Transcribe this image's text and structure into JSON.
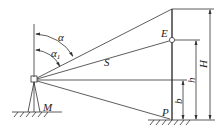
{
  "diagram": {
    "labels": {
      "alpha": "α",
      "alpha1": "α",
      "alpha1_sub": "1",
      "slope": "S",
      "point_E": "E",
      "point_P": "P",
      "station_M": "M",
      "height_H": "H",
      "height_h": "h",
      "height_b": "b"
    },
    "colors": {
      "line": "#333333",
      "background": "#ffffff"
    }
  }
}
